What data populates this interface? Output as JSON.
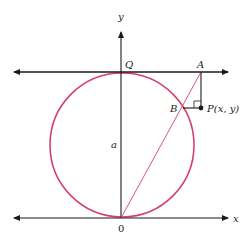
{
  "figure": {
    "labels": {
      "y_axis": "y",
      "x_axis": "x",
      "Q": "Q",
      "A": "A",
      "B": "B",
      "P": "P(x, y)",
      "a": "a",
      "origin": "0"
    },
    "colors": {
      "circle": "#d6416a",
      "axis": "#1a1a1a",
      "secant": "#d6416a"
    }
  }
}
